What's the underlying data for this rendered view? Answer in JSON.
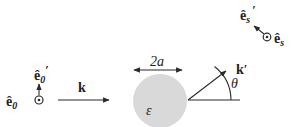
{
  "diagram": {
    "type": "scattering-geometry",
    "incident": {
      "polarization_out_of_plane": {
        "label": "ê",
        "sub": "0",
        "symbol": "dot-in-circle"
      },
      "polarization_in_plane": {
        "label": "ê",
        "sub": "0",
        "prime": "′"
      },
      "wavevector": {
        "label": "k"
      }
    },
    "scatterer": {
      "diameter_label": "2a",
      "permittivity_label": "ε",
      "fill": "#d9d9d9"
    },
    "scattered": {
      "wavevector": {
        "label": "k",
        "prime": "′"
      },
      "angle_label": "θ",
      "polarization_out_of_plane": {
        "label": "ê",
        "sub": "s",
        "symbol": "dot-in-circle"
      },
      "polarization_in_plane": {
        "label": "ê",
        "sub": "s",
        "prime": "′"
      }
    },
    "colors": {
      "stroke": "#2a2a2a",
      "text": "#222222",
      "sphere": "#d9d9d9"
    }
  }
}
